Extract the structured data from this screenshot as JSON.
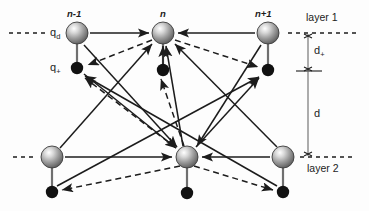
{
  "figure": {
    "type": "physics-schematic-diagram",
    "title": "",
    "background_color": "#fdfdfd",
    "stroke_color": "#1c1c1c",
    "node_fill_top": "#f2f2f2",
    "node_fill_mid": "#9a9a9a",
    "node_fill_edge": "#5a5a5a",
    "dot_color": "#111111"
  },
  "labels": {
    "index_left": "n-1",
    "index_center": "n",
    "index_right": "n+1",
    "charge_d": "q",
    "charge_d_sub": "d",
    "charge_plus": "q",
    "charge_plus_sub": "+",
    "layer_one": "layer 1",
    "layer_two": "layer 2",
    "distance_plus": "d",
    "distance_plus_sub": "+",
    "distance_total": "d"
  },
  "nodes": [
    {
      "id": "top-left",
      "kind": "sphere",
      "label": "n-1",
      "x": 77,
      "y": 33,
      "r": 11,
      "layer": "layer 1"
    },
    {
      "id": "top-center",
      "kind": "sphere",
      "label": "n",
      "x": 163,
      "y": 33,
      "r": 11,
      "layer": "layer 1"
    },
    {
      "id": "top-right",
      "kind": "sphere",
      "label": "n+1",
      "x": 268,
      "y": 33,
      "r": 11,
      "layer": "layer 1"
    },
    {
      "id": "bot-left",
      "kind": "sphere",
      "label": "",
      "x": 52,
      "y": 157,
      "r": 11,
      "layer": "layer 2"
    },
    {
      "id": "bot-center",
      "kind": "sphere",
      "label": "",
      "x": 187,
      "y": 157,
      "r": 11,
      "layer": "layer 2"
    },
    {
      "id": "bot-right",
      "kind": "sphere",
      "label": "",
      "x": 283,
      "y": 157,
      "r": 11,
      "layer": "layer 2"
    },
    {
      "id": "dot-top-left",
      "kind": "dot",
      "label": "q+",
      "x": 77,
      "y": 68,
      "r": 6
    },
    {
      "id": "dot-top-center",
      "kind": "dot",
      "label": "",
      "x": 163,
      "y": 70,
      "r": 6
    },
    {
      "id": "dot-top-right",
      "kind": "dot",
      "label": "",
      "x": 268,
      "y": 70,
      "r": 6
    },
    {
      "id": "dot-bot-left",
      "kind": "dot",
      "label": "",
      "x": 52,
      "y": 192,
      "r": 6
    },
    {
      "id": "dot-bot-center",
      "kind": "dot",
      "label": "",
      "x": 187,
      "y": 193,
      "r": 6
    },
    {
      "id": "dot-bot-right",
      "kind": "dot",
      "label": "",
      "x": 283,
      "y": 192,
      "r": 6
    }
  ],
  "layer_lines": [
    {
      "id": "layer1-left",
      "x1": 9,
      "y": 33,
      "x2": 49,
      "style": "dashed"
    },
    {
      "id": "layer1-right",
      "x1": 288,
      "y": 33,
      "x2": 356,
      "style": "dashed"
    },
    {
      "id": "layer2-left",
      "x1": 13,
      "y": 157,
      "x2": 37,
      "style": "dashed"
    },
    {
      "id": "layer2-right",
      "x1": 300,
      "y": 157,
      "x2": 356,
      "style": "dashed"
    }
  ],
  "dimension_markers": [
    {
      "id": "d-plus",
      "from_y": 33,
      "to_y": 71,
      "x": 308,
      "label": "d+"
    },
    {
      "id": "d-total",
      "from_y": 71,
      "to_y": 157,
      "x": 308,
      "label": "d"
    }
  ],
  "edges_solid": [
    {
      "from": "top-left",
      "to": "top-center",
      "note": "horizontal in-layer"
    },
    {
      "from": "top-right",
      "to": "top-center",
      "note": "horizontal in-layer"
    },
    {
      "from": "bot-left",
      "to": "bot-center",
      "note": "horizontal in-layer"
    },
    {
      "from": "bot-right",
      "to": "bot-center",
      "note": "horizontal in-layer"
    },
    {
      "from": "bot-center",
      "to": "top-center",
      "note": "vertical up"
    },
    {
      "from": "dot-top-center",
      "to": "top-center",
      "note": "short vertical up"
    },
    {
      "from": "bot-left",
      "to": "top-center"
    },
    {
      "from": "bot-right",
      "to": "top-center"
    },
    {
      "from": "bot-center",
      "to": "dot-top-right"
    },
    {
      "from": "top-left",
      "to": "bot-center"
    },
    {
      "from": "top-right",
      "to": "bot-center"
    },
    {
      "from": "dot-top-left",
      "to": "bot-center"
    },
    {
      "from": "dot-bot-left",
      "to": "dot-top-right"
    },
    {
      "from": "dot-bot-right",
      "to": "dot-top-left"
    }
  ],
  "edges_dashed": [
    {
      "from": "top-center",
      "to": "dot-top-left"
    },
    {
      "from": "top-center",
      "to": "dot-top-right"
    },
    {
      "from": "bot-center",
      "to": "dot-bot-left"
    },
    {
      "from": "bot-center",
      "to": "dot-bot-right"
    },
    {
      "from": "bot-center",
      "to": "dot-top-center"
    },
    {
      "from": "bot-center",
      "to": "dot-top-left"
    }
  ],
  "rigid_rods": [
    {
      "from": "top-left",
      "to": "dot-top-left"
    },
    {
      "from": "top-center",
      "to": "dot-top-center"
    },
    {
      "from": "top-right",
      "to": "dot-top-right"
    },
    {
      "from": "bot-left",
      "to": "dot-bot-left"
    },
    {
      "from": "bot-center",
      "to": "dot-bot-center"
    },
    {
      "from": "bot-right",
      "to": "dot-bot-right"
    }
  ]
}
